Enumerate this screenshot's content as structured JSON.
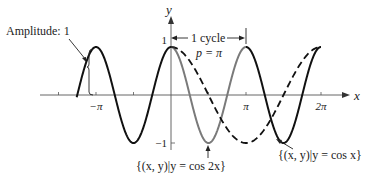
{
  "chart_data": {
    "type": "line",
    "title": "",
    "xlabel": "x",
    "ylabel": "y",
    "xlim": [
      -4.35,
      6.8
    ],
    "ylim": [
      -1,
      1
    ],
    "x_ticks": [
      {
        "value": -4.712389,
        "label": ""
      },
      {
        "value": -3.141593,
        "label": "−π"
      },
      {
        "value": -1.570796,
        "label": ""
      },
      {
        "value": 1.570796,
        "label": ""
      },
      {
        "value": 3.141593,
        "label": "π"
      },
      {
        "value": 6.283185,
        "label": "2π"
      }
    ],
    "y_ticks": [
      {
        "value": 1,
        "label": "1"
      },
      {
        "value": -1,
        "label": "−1"
      }
    ],
    "series": [
      {
        "name": "y = cos 2x",
        "function": "cos(2x)",
        "x_range": [
          -3.95,
          6.283185
        ],
        "style": "solid",
        "color": "#111111",
        "highlight": {
          "x_range": [
            0,
            3.141593
          ],
          "color": "#7a7a7a"
        }
      },
      {
        "name": "y = cos x",
        "function": "cos(x)",
        "x_range": [
          0,
          6.283185
        ],
        "style": "dashed",
        "color": "#111111"
      }
    ],
    "annotations": {
      "amplitude": "Amplitude: 1",
      "cycle": "1 cycle",
      "period": "p = π",
      "cos2x_label": "{(x, y)|y = cos 2x}",
      "cosx_label": "{(x, y)|y = cos x}"
    }
  }
}
